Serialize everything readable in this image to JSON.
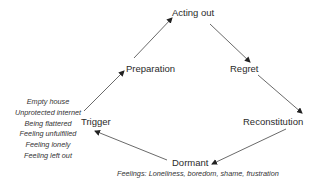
{
  "diagram": {
    "type": "cycle",
    "nodes": {
      "acting_out": "Acting out",
      "regret": "Regret",
      "reconstitution": "Reconstitution",
      "dormant": "Dormant",
      "trigger": "Trigger",
      "preparation": "Preparation"
    },
    "dormant_note": "Feelings: Loneliness, boredom, shame, frustration",
    "trigger_list": [
      "Empty house",
      "Unprotected internet",
      "Being flattered",
      "Feeling unfulfilled",
      "Feeling lonely",
      "Feeling left out"
    ],
    "edges": [
      {
        "from": "Trigger",
        "to": "Preparation"
      },
      {
        "from": "Preparation",
        "to": "Acting out"
      },
      {
        "from": "Acting out",
        "to": "Regret"
      },
      {
        "from": "Regret",
        "to": "Reconstitution"
      },
      {
        "from": "Reconstitution",
        "to": "Dormant"
      },
      {
        "from": "Dormant",
        "to": "Trigger"
      }
    ]
  }
}
